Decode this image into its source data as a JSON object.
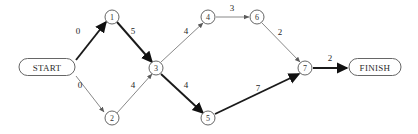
{
  "diagram": {
    "colors": {
      "background": "#ffffff",
      "edge_dark": "#1a1a1a",
      "edge_light": "#7a7a7a",
      "node_stroke": "#555555",
      "text": "#1f1f1f"
    },
    "terminals": [
      {
        "id": "start",
        "label": "START",
        "x": 47,
        "y": 67,
        "w": 56,
        "h": 17
      },
      {
        "id": "finish",
        "label": "FINISH",
        "x": 375,
        "y": 67,
        "w": 52,
        "h": 17
      }
    ],
    "nodes": [
      {
        "id": "n1",
        "label": "1",
        "x": 112,
        "y": 17,
        "r": 7
      },
      {
        "id": "n2",
        "label": "2",
        "x": 112,
        "y": 118,
        "r": 7
      },
      {
        "id": "n3",
        "label": "3",
        "x": 156,
        "y": 68,
        "r": 7
      },
      {
        "id": "n4",
        "label": "4",
        "x": 208,
        "y": 17,
        "r": 7
      },
      {
        "id": "n5",
        "label": "5",
        "x": 208,
        "y": 118,
        "r": 7
      },
      {
        "id": "n6",
        "label": "6",
        "x": 257,
        "y": 17,
        "r": 7
      },
      {
        "id": "n7",
        "label": "7",
        "x": 305,
        "y": 68,
        "r": 7
      }
    ],
    "edges": [
      {
        "id": "start-1",
        "from": "START",
        "to": "1",
        "weight": "0",
        "x1": 76,
        "y1": 60,
        "x2": 106,
        "y2": 22,
        "label_x": 78,
        "label_y": 31,
        "style": "thick"
      },
      {
        "id": "start-2",
        "from": "START",
        "to": "2",
        "weight": "0",
        "x1": 76,
        "y1": 76,
        "x2": 106,
        "y2": 114,
        "label_x": 80,
        "label_y": 85,
        "style": "thin"
      },
      {
        "id": "1-3",
        "from": "1",
        "to": "3",
        "weight": "5",
        "x1": 117,
        "y1": 22,
        "x2": 152,
        "y2": 62,
        "label_x": 133,
        "label_y": 31,
        "style": "thick"
      },
      {
        "id": "2-3",
        "from": "2",
        "to": "3",
        "weight": "4",
        "x1": 117,
        "y1": 113,
        "x2": 152,
        "y2": 74,
        "label_x": 133,
        "label_y": 85,
        "style": "thin"
      },
      {
        "id": "3-4",
        "from": "3",
        "to": "4",
        "weight": "4",
        "x1": 161,
        "y1": 62,
        "x2": 203,
        "y2": 23,
        "label_x": 186,
        "label_y": 31,
        "style": "thin"
      },
      {
        "id": "3-5",
        "from": "3",
        "to": "5",
        "weight": "4",
        "x1": 161,
        "y1": 74,
        "x2": 203,
        "y2": 113,
        "label_x": 186,
        "label_y": 85,
        "style": "thick"
      },
      {
        "id": "4-6",
        "from": "4",
        "to": "6",
        "weight": "3",
        "x1": 216,
        "y1": 17,
        "x2": 249,
        "y2": 17,
        "label_x": 232,
        "label_y": 8,
        "style": "thin"
      },
      {
        "id": "6-7",
        "from": "6",
        "to": "7",
        "weight": "2",
        "x1": 262,
        "y1": 23,
        "x2": 300,
        "y2": 62,
        "label_x": 280,
        "label_y": 32,
        "style": "thin"
      },
      {
        "id": "5-7",
        "from": "5",
        "to": "7",
        "weight": "7",
        "x1": 215,
        "y1": 114,
        "x2": 300,
        "y2": 74,
        "label_x": 258,
        "label_y": 88,
        "style": "thick"
      },
      {
        "id": "7-finish",
        "from": "7",
        "to": "FINISH",
        "weight": "2",
        "x1": 313,
        "y1": 68,
        "x2": 347,
        "y2": 68,
        "label_x": 330,
        "label_y": 58,
        "style": "thick"
      }
    ]
  }
}
